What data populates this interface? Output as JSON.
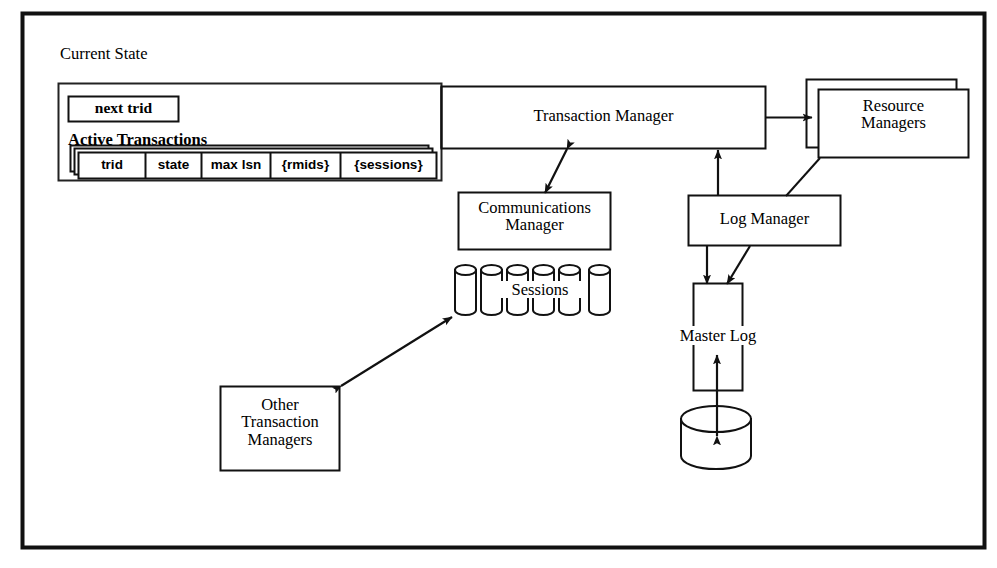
{
  "figure": {
    "kind": "architecture-block-diagram",
    "background_color": "#ffffff",
    "line_color": "#000000",
    "frame": {
      "label": "diagram-frame"
    }
  },
  "labels": {
    "current_state": "Current State",
    "next_trid": "next trid",
    "active_transactions": "Active Transactions",
    "transaction_manager": "Transaction Manager",
    "resource_managers": "Resource\nManagers",
    "communications_manager": "Communications\nManager",
    "log_manager": "Log Manager",
    "master_log": "Master Log",
    "sessions": "Sessions",
    "other_transaction_managers": "Other\nTransaction\nManagers"
  },
  "active_transactions_table": {
    "columns": [
      "trid",
      "state",
      "max lsn",
      "{rmids}",
      "{sessions}"
    ],
    "stacked_copies": 3
  },
  "sessions": {
    "cylinder_count": 6,
    "label": "Sessions"
  },
  "storage": {
    "disk_label": "",
    "shape": "cylinder"
  },
  "connections": [
    {
      "from": "current-state",
      "to": "transaction-manager",
      "style": "plain-line",
      "arrowheads": "none"
    },
    {
      "from": "transaction-manager",
      "to": "resource-managers",
      "style": "line",
      "arrowheads": "end"
    },
    {
      "from": "transaction-manager",
      "to": "communications-manager",
      "style": "line",
      "arrowheads": "both"
    },
    {
      "from": "log-manager",
      "to": "transaction-manager",
      "style": "line",
      "arrowheads": "end"
    },
    {
      "from": "resource-managers",
      "to": "log-manager",
      "style": "plain-line",
      "arrowheads": "none"
    },
    {
      "from": "log-manager",
      "to": "master-log",
      "style": "line",
      "arrowheads": "end"
    },
    {
      "from": "log-manager",
      "to": "master-log",
      "style": "diagonal-line",
      "arrowheads": "end"
    },
    {
      "from": "master-log",
      "to": "disk",
      "style": "line",
      "arrowheads": "both"
    },
    {
      "from": "other-transaction-managers",
      "to": "sessions",
      "style": "line",
      "arrowheads": "both"
    }
  ]
}
